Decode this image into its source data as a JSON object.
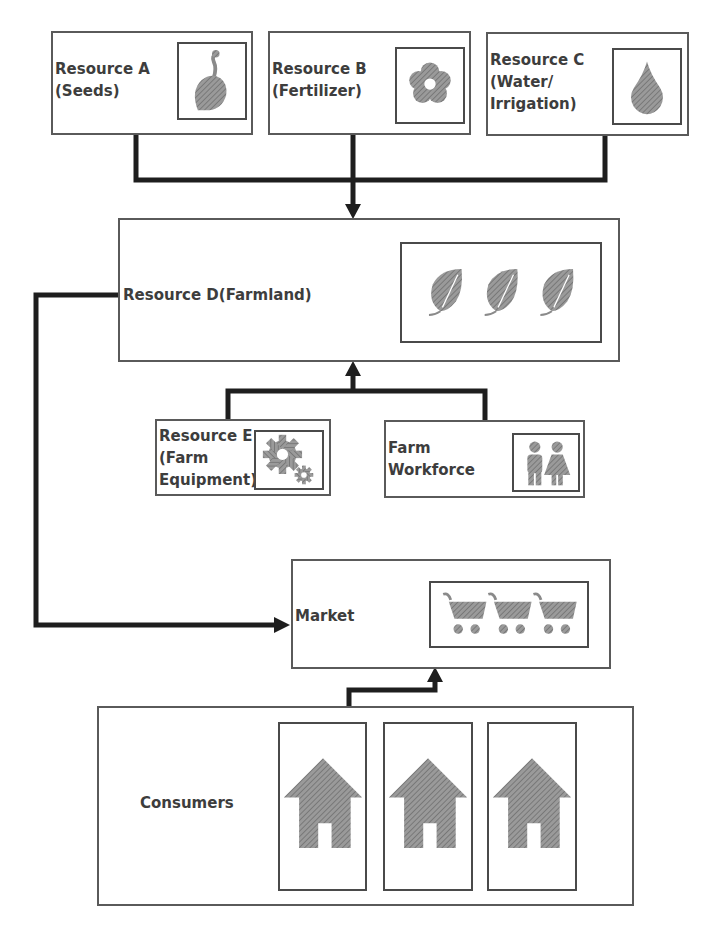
{
  "diagram": {
    "type": "flow",
    "title": "",
    "nodes": {
      "resource_a": {
        "label_line1": "Resource A",
        "label_line2": "(Seeds)",
        "icon": "seed-icon"
      },
      "resource_b": {
        "label_line1": "Resource B",
        "label_line2": "(Fertilizer)",
        "icon": "flower-icon"
      },
      "resource_c": {
        "label_line1": "Resource C",
        "label_line2": "(Water/",
        "label_line3": "Irrigation)",
        "icon": "water-drop-icon"
      },
      "resource_d": {
        "label": "Resource D(Farmland)",
        "icon": "leaf-icon",
        "icon_count": 3
      },
      "resource_e": {
        "label_line1": "Resource E",
        "label_line2": "(Farm",
        "label_line3": "Equipment)",
        "icon": "gears-icon"
      },
      "workforce": {
        "label_line1": "Farm",
        "label_line2": "Workforce",
        "icon": "people-icon"
      },
      "market": {
        "label": "Market",
        "icon": "shopping-cart-icon",
        "icon_count": 3
      },
      "consumers": {
        "label": "Consumers",
        "icon": "house-icon",
        "icon_count": 3
      }
    },
    "edges": [
      {
        "from": "resource_a",
        "to": "resource_d"
      },
      {
        "from": "resource_b",
        "to": "resource_d"
      },
      {
        "from": "resource_c",
        "to": "resource_d"
      },
      {
        "from": "resource_e",
        "to": "resource_d"
      },
      {
        "from": "workforce",
        "to": "resource_d"
      },
      {
        "from": "resource_d",
        "to": "market"
      },
      {
        "from": "consumers",
        "to": "market"
      }
    ],
    "colors": {
      "line": "#1e1e1e",
      "border": "#5a5a5a",
      "icon_fill": "#8a8a8a",
      "text": "#3d3d3d"
    }
  }
}
